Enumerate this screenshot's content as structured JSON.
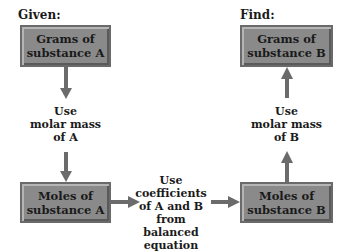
{
  "labels": {
    "given": "Given:",
    "find": "Find:"
  },
  "boxes": {
    "grams_a": {
      "line1": "Grams of",
      "line2": "substance A"
    },
    "moles_a": {
      "line1": "Moles of",
      "line2": "substance A"
    },
    "grams_b": {
      "line1": "Grams of",
      "line2": "substance B"
    },
    "moles_b": {
      "line1": "Moles of",
      "line2": "substance B"
    }
  },
  "notes": {
    "molar_mass_a": [
      "Use",
      "molar mass",
      "of A"
    ],
    "coefficients": [
      "Use",
      "coefficients",
      "of A and B",
      "from",
      "balanced equation"
    ],
    "molar_mass_b": [
      "Use",
      "molar mass",
      "of B"
    ]
  },
  "colors": {
    "box_fill": "#8a8a8a",
    "arrow": "#6b6b6b"
  }
}
